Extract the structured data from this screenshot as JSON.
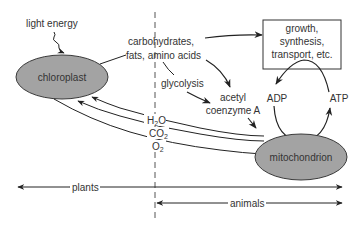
{
  "colors": {
    "ellipse_fill": "#a3a3a3",
    "ellipse_stroke": "#3a3a3a",
    "line": "#222222",
    "text": "#333333",
    "background": "#ffffff"
  },
  "nodes": {
    "chloroplast": {
      "label": "chloroplast"
    },
    "mitochondrion": {
      "label": "mitochondrion"
    },
    "growth_box": {
      "line1": "growth,",
      "line2": "synthesis,",
      "line3": "transport, etc."
    }
  },
  "labels": {
    "light_energy": "light  energy",
    "carbs_line1": "carbohydrates,",
    "carbs_line2": "fats, amino acids",
    "glycolysis": "glycolysis",
    "acetyl_line1": "acetyl",
    "acetyl_line2": "coenzyme A",
    "adp": "ADP",
    "atp": "ATP",
    "h2o_base": "H",
    "h2o_sub": "2",
    "h2o_end": "O",
    "co2_base": "CO",
    "co2_sub": "2",
    "o2_base": "O",
    "o2_sub": "2",
    "plants": "plants",
    "animals": "animals"
  }
}
